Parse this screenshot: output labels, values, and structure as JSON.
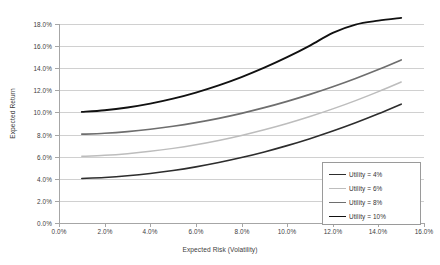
{
  "chart_data": {
    "type": "line",
    "title": "",
    "subtitle": "",
    "xlabel": "Expected Risk (Volatility)",
    "ylabel": "Expected Return",
    "xlim": [
      0.0,
      16.0
    ],
    "ylim": [
      0.0,
      18.0
    ],
    "x_ticks": [
      "0.0%",
      "2.0%",
      "4.0%",
      "6.0%",
      "8.0%",
      "10.0%",
      "12.0%",
      "14.0%",
      "16.0%"
    ],
    "x_tick_values": [
      0.0,
      2.0,
      4.0,
      6.0,
      8.0,
      10.0,
      12.0,
      14.0,
      16.0
    ],
    "y_ticks": [
      "0.0%",
      "2.0%",
      "4.0%",
      "6.0%",
      "8.0%",
      "10.0%",
      "12.0%",
      "14.0%",
      "16.0%",
      "18.0%"
    ],
    "y_tick_values": [
      0.0,
      2.0,
      4.0,
      6.0,
      8.0,
      10.0,
      12.0,
      14.0,
      16.0,
      18.0
    ],
    "grid": "horizontal",
    "legend_position": "bottom-right",
    "x": [
      1.0,
      2.0,
      3.0,
      4.0,
      5.0,
      6.0,
      7.0,
      8.0,
      9.0,
      10.0,
      11.0,
      12.0,
      13.0,
      14.0,
      15.0
    ],
    "series": [
      {
        "name": "Utility = 4%",
        "color": "#2d2d2d",
        "width": 1.6,
        "values": [
          4.03,
          4.12,
          4.27,
          4.48,
          4.75,
          5.08,
          5.47,
          5.92,
          6.43,
          7.0,
          7.63,
          8.32,
          9.07,
          9.88,
          10.75
        ]
      },
      {
        "name": "Utility = 6%",
        "color": "#bdbdbd",
        "width": 1.5,
        "values": [
          6.03,
          6.12,
          6.27,
          6.48,
          6.75,
          7.08,
          7.47,
          7.92,
          8.43,
          9.0,
          9.63,
          10.32,
          11.07,
          11.88,
          12.75
        ]
      },
      {
        "name": "Utility = 8%",
        "color": "#6e6e6e",
        "width": 1.7,
        "values": [
          8.03,
          8.12,
          8.27,
          8.48,
          8.75,
          9.08,
          9.47,
          9.92,
          10.43,
          11.0,
          11.63,
          12.32,
          13.07,
          13.88,
          14.75
        ]
      },
      {
        "name": "Utility = 10%",
        "color": "#111111",
        "width": 1.9,
        "values": [
          10.05,
          10.2,
          10.45,
          10.8,
          11.25,
          11.8,
          12.45,
          13.2,
          14.05,
          15.0,
          16.05,
          17.2,
          17.95,
          18.3,
          18.55
        ]
      }
    ]
  },
  "legend": {
    "items": [
      {
        "label": "Utility = 4%"
      },
      {
        "label": "Utility = 6%"
      },
      {
        "label": "Utility = 8%"
      },
      {
        "label": "Utility = 10%"
      }
    ]
  }
}
